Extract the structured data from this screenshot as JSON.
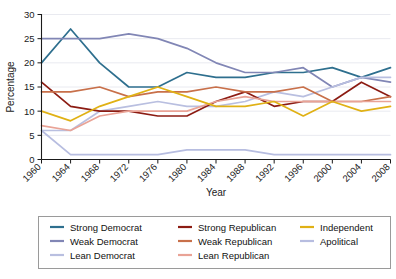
{
  "chart_data": {
    "type": "line",
    "title": "",
    "xlabel": "Year",
    "ylabel": "Percentage",
    "x": [
      1960,
      1964,
      1968,
      1972,
      1976,
      1980,
      1984,
      1988,
      1992,
      1996,
      2000,
      2004,
      2008
    ],
    "categories": [
      "1960",
      "1964",
      "1968",
      "1972",
      "1976",
      "1980",
      "1984",
      "1988",
      "1992",
      "1996",
      "2000",
      "2004",
      "2008"
    ],
    "xlim": [
      1960,
      2008
    ],
    "ylim": [
      0,
      30
    ],
    "yticks": [
      0,
      5,
      10,
      15,
      20,
      25,
      30
    ],
    "grid": true,
    "legend_position": "bottom",
    "series": [
      {
        "name": "Strong Democrat",
        "color": "#2e6f8e",
        "values": [
          20,
          27,
          20,
          15,
          15,
          18,
          17,
          17,
          18,
          18,
          19,
          17,
          19
        ]
      },
      {
        "name": "Weak Democrat",
        "color": "#8186b5",
        "values": [
          25,
          25,
          25,
          26,
          25,
          23,
          20,
          18,
          18,
          19,
          15,
          17,
          16
        ]
      },
      {
        "name": "Lean Democrat",
        "color": "#b9bfe0",
        "values": [
          6,
          6,
          10,
          11,
          12,
          11,
          11,
          12,
          14,
          13,
          15,
          17,
          17
        ]
      },
      {
        "name": "Strong Republican",
        "color": "#8c1c13",
        "values": [
          16,
          11,
          10,
          10,
          9,
          9,
          12,
          14,
          11,
          12,
          12,
          16,
          13
        ]
      },
      {
        "name": "Weak Republican",
        "color": "#c8704a",
        "values": [
          14,
          14,
          15,
          13,
          14,
          14,
          15,
          14,
          14,
          15,
          12,
          12,
          13
        ]
      },
      {
        "name": "Lean Republican",
        "color": "#e9a396",
        "values": [
          7,
          6,
          9,
          10,
          10,
          10,
          12,
          13,
          12,
          12,
          12,
          12,
          12
        ]
      },
      {
        "name": "Independent",
        "color": "#e0b115",
        "values": [
          10,
          8,
          11,
          13,
          15,
          13,
          11,
          11,
          12,
          9,
          12,
          10,
          11
        ]
      },
      {
        "name": "Apolitical",
        "color": "#b7bde0",
        "values": [
          6,
          1,
          1,
          1,
          1,
          2,
          2,
          2,
          1,
          1,
          1,
          1,
          1
        ]
      }
    ],
    "legend_columns": [
      [
        "Strong Democrat",
        "Weak Democrat",
        "Lean Democrat"
      ],
      [
        "Strong Republican",
        "Weak Republican",
        "Lean Republican"
      ],
      [
        "Independent",
        "Apolitical"
      ]
    ]
  }
}
